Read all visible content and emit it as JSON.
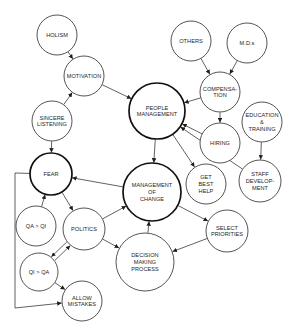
{
  "diagram": {
    "nodes": [
      {
        "id": "holism",
        "lines": [
          "HOLISM"
        ],
        "cx": 57,
        "cy": 35,
        "r": 20,
        "bold": false
      },
      {
        "id": "motivation",
        "lines": [
          "MOTIVATION"
        ],
        "cx": 84,
        "cy": 76,
        "r": 20,
        "bold": false
      },
      {
        "id": "sincere-listening",
        "lines": [
          "SINCERE",
          "LISTENING"
        ],
        "cx": 52,
        "cy": 121,
        "r": 20,
        "bold": false
      },
      {
        "id": "fear",
        "lines": [
          "FEAR"
        ],
        "cx": 51,
        "cy": 174,
        "r": 21,
        "bold": true
      },
      {
        "id": "qa-gt-qi",
        "lines": [
          "QA > QI"
        ],
        "cx": 36,
        "cy": 226,
        "r": 20,
        "bold": false
      },
      {
        "id": "politics",
        "lines": [
          "POLITICS"
        ],
        "cx": 84,
        "cy": 229,
        "r": 21,
        "bold": false
      },
      {
        "id": "qi-gt-qa",
        "lines": [
          "QI > QA"
        ],
        "cx": 39,
        "cy": 272,
        "r": 19,
        "bold": false
      },
      {
        "id": "allow-mistakes",
        "lines": [
          "ALLOW",
          "MISTAKES"
        ],
        "cx": 82,
        "cy": 301,
        "r": 20,
        "bold": false
      },
      {
        "id": "people-management",
        "lines": [
          "PEOPLE",
          "MANAGEMENT"
        ],
        "cx": 157,
        "cy": 111,
        "r": 28,
        "bold": true
      },
      {
        "id": "management-of-change",
        "lines": [
          "MANAGEMENT",
          "OF",
          "CHANGE"
        ],
        "cx": 152,
        "cy": 192,
        "r": 29,
        "bold": true
      },
      {
        "id": "decision-making-process",
        "lines": [
          "DECISION",
          "MAKING",
          "PROCESS"
        ],
        "cx": 145,
        "cy": 262,
        "r": 29,
        "bold": false
      },
      {
        "id": "others",
        "lines": [
          "OTHERS"
        ],
        "cx": 191,
        "cy": 41,
        "r": 20,
        "bold": false
      },
      {
        "id": "mds",
        "lines": [
          "M.D.s"
        ],
        "cx": 247,
        "cy": 43,
        "r": 20,
        "bold": false
      },
      {
        "id": "compensation",
        "lines": [
          "COMPENSA-",
          "TION"
        ],
        "cx": 220,
        "cy": 92,
        "r": 20,
        "bold": false
      },
      {
        "id": "hiring",
        "lines": [
          "HIRING"
        ],
        "cx": 220,
        "cy": 143,
        "r": 20,
        "bold": false
      },
      {
        "id": "education-training",
        "lines": [
          "EDUCATION",
          "&",
          "TRAINING"
        ],
        "cx": 262,
        "cy": 122,
        "r": 20,
        "bold": false
      },
      {
        "id": "staff-development",
        "lines": [
          "STAFF",
          "DEVELOP-",
          "MENT"
        ],
        "cx": 260,
        "cy": 181,
        "r": 21,
        "bold": false
      },
      {
        "id": "get-best-help",
        "lines": [
          "GET",
          "BEST",
          "HELP"
        ],
        "cx": 206,
        "cy": 184,
        "r": 20,
        "bold": false
      },
      {
        "id": "select-priorities",
        "lines": [
          "SELECT",
          "PRIORITIES"
        ],
        "cx": 227,
        "cy": 231,
        "r": 21,
        "bold": false
      }
    ],
    "edges": [
      {
        "from": "holism",
        "to": "motivation"
      },
      {
        "from": "sincere-listening",
        "to": "motivation"
      },
      {
        "from": "motivation",
        "to": "people-management"
      },
      {
        "from": "sincere-listening",
        "to": "fear"
      },
      {
        "from": "others",
        "to": "compensation"
      },
      {
        "from": "mds",
        "to": "compensation"
      },
      {
        "from": "compensation",
        "to": "people-management"
      },
      {
        "from": "compensation",
        "to": "hiring"
      },
      {
        "from": "hiring",
        "to": "people-management"
      },
      {
        "from": "education-training",
        "to": "staff-development"
      },
      {
        "from": "staff-development",
        "to": "people-management"
      },
      {
        "from": "people-management",
        "to": "get-best-help"
      },
      {
        "from": "people-management",
        "to": "management-of-change"
      },
      {
        "from": "management-of-change",
        "to": "fear"
      },
      {
        "from": "fear",
        "to": "politics"
      },
      {
        "from": "qa-gt-qi",
        "to": "fear"
      },
      {
        "from": "politics",
        "to": "management-of-change"
      },
      {
        "from": "politics",
        "to": "decision-making-process"
      },
      {
        "from": "politics",
        "to": "qi-gt-qa",
        "offset": 2.5
      },
      {
        "from": "qi-gt-qa",
        "to": "politics",
        "offset": 2.5
      },
      {
        "from": "qi-gt-qa",
        "to": "allow-mistakes"
      },
      {
        "from": "fear",
        "to": "allow-mistakes",
        "via": [
          [
            15,
            173
          ],
          [
            15,
            308
          ]
        ]
      },
      {
        "from": "management-of-change",
        "to": "select-priorities"
      },
      {
        "from": "select-priorities",
        "to": "decision-making-process"
      },
      {
        "from": "decision-making-process",
        "to": "management-of-change"
      }
    ]
  }
}
